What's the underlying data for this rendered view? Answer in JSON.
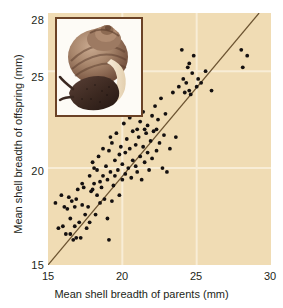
{
  "figure": {
    "kind": "scatter-plot",
    "background_color": "#ffffff",
    "plot_background_color": "#f0dcb4",
    "gridline_color": "#f8edd6",
    "point_color": "#141010",
    "line_color": "#6b5330",
    "inset": {
      "name": "snail-photo",
      "caption": "",
      "border_color": "#6b4226",
      "background_color": "#fdfbf6"
    }
  },
  "chart_data": {
    "type": "scatter",
    "title": "",
    "xlabel": "Mean shell breadth of parents (mm)",
    "ylabel": "Mean shell breadth of offspring (mm)",
    "xlim": [
      15,
      30
    ],
    "ylim": [
      15,
      28
    ],
    "xticks": [
      15,
      20,
      25,
      30
    ],
    "xticklabels": [
      "15",
      "20",
      "25",
      "30"
    ],
    "yticks": [
      15,
      20,
      25,
      28
    ],
    "yticklabels": [
      "15",
      "20",
      "25",
      "28"
    ],
    "grid": true,
    "gridlines_x": [
      20,
      25
    ],
    "gridlines_y": [
      20,
      25
    ],
    "legend": null,
    "trendline": {
      "type": "line",
      "label": "regression line",
      "x": [
        15.0,
        29.2
      ],
      "y": [
        15.0,
        28.0
      ]
    },
    "points": [
      [
        15.5,
        18.2
      ],
      [
        15.7,
        16.9
      ],
      [
        15.9,
        18.6
      ],
      [
        16.0,
        17.0
      ],
      [
        16.1,
        18.0
      ],
      [
        16.2,
        16.6
      ],
      [
        16.3,
        17.9
      ],
      [
        16.4,
        18.5
      ],
      [
        16.5,
        16.6
      ],
      [
        16.5,
        17.4
      ],
      [
        16.6,
        18.3
      ],
      [
        16.7,
        16.3
      ],
      [
        16.8,
        17.0
      ],
      [
        16.9,
        18.4
      ],
      [
        16.9,
        16.4
      ],
      [
        17.0,
        18.9
      ],
      [
        17.1,
        17.2
      ],
      [
        17.2,
        16.4
      ],
      [
        17.3,
        18.1
      ],
      [
        17.4,
        19.0
      ],
      [
        17.5,
        17.6
      ],
      [
        17.6,
        16.9
      ],
      [
        17.7,
        18.0
      ],
      [
        17.8,
        19.6
      ],
      [
        17.8,
        17.2
      ],
      [
        17.9,
        18.8
      ],
      [
        18.0,
        20.3
      ],
      [
        18.0,
        18.9
      ],
      [
        18.1,
        19.2
      ],
      [
        18.2,
        17.6
      ],
      [
        18.3,
        19.9
      ],
      [
        18.3,
        18.6
      ],
      [
        18.4,
        20.6
      ],
      [
        18.5,
        19.3
      ],
      [
        18.5,
        18.2
      ],
      [
        18.6,
        19.0
      ],
      [
        18.7,
        21.0
      ],
      [
        18.7,
        19.6
      ],
      [
        18.8,
        18.4
      ],
      [
        18.9,
        20.1
      ],
      [
        19.0,
        19.4
      ],
      [
        19.0,
        17.4
      ],
      [
        19.1,
        20.9
      ],
      [
        19.1,
        16.3
      ],
      [
        19.2,
        19.8
      ],
      [
        19.3,
        18.3
      ],
      [
        19.3,
        21.3
      ],
      [
        19.4,
        19.1
      ],
      [
        19.5,
        20.4
      ],
      [
        19.5,
        19.6
      ],
      [
        19.6,
        21.8
      ],
      [
        19.7,
        19.9
      ],
      [
        19.8,
        20.7
      ],
      [
        19.8,
        18.6
      ],
      [
        19.9,
        21.1
      ],
      [
        20.0,
        19.4
      ],
      [
        20.0,
        20.2
      ],
      [
        20.1,
        22.3
      ],
      [
        20.2,
        20.8
      ],
      [
        20.2,
        19.7
      ],
      [
        20.3,
        21.5
      ],
      [
        20.4,
        20.0
      ],
      [
        20.5,
        22.6
      ],
      [
        20.5,
        21.0
      ],
      [
        20.6,
        19.5
      ],
      [
        20.7,
        21.9
      ],
      [
        20.7,
        20.4
      ],
      [
        20.8,
        23.4
      ],
      [
        20.9,
        21.2
      ],
      [
        20.9,
        20.1
      ],
      [
        21.0,
        22.0
      ],
      [
        21.0,
        19.8
      ],
      [
        21.1,
        21.6
      ],
      [
        21.2,
        20.6
      ],
      [
        21.2,
        22.4
      ],
      [
        21.3,
        19.4
      ],
      [
        21.4,
        21.1
      ],
      [
        21.4,
        22.9
      ],
      [
        21.5,
        20.3
      ],
      [
        21.6,
        21.8
      ],
      [
        21.7,
        20.8
      ],
      [
        21.7,
        22.2
      ],
      [
        21.8,
        19.9
      ],
      [
        21.9,
        21.4
      ],
      [
        22.0,
        22.7
      ],
      [
        22.0,
        20.5
      ],
      [
        22.1,
        21.9
      ],
      [
        22.2,
        23.2
      ],
      [
        22.3,
        20.9
      ],
      [
        22.4,
        22.5
      ],
      [
        22.5,
        21.3
      ],
      [
        22.6,
        23.6
      ],
      [
        22.7,
        20.0
      ],
      [
        22.8,
        21.7
      ],
      [
        22.9,
        22.8
      ],
      [
        23.0,
        19.8
      ],
      [
        23.2,
        21.0
      ],
      [
        23.4,
        23.9
      ],
      [
        23.6,
        21.6
      ],
      [
        23.8,
        24.2
      ],
      [
        24.0,
        26.1
      ],
      [
        24.1,
        24.6
      ],
      [
        24.2,
        23.9
      ],
      [
        24.3,
        24.4
      ],
      [
        24.4,
        25.2
      ],
      [
        24.5,
        24.0
      ],
      [
        24.5,
        25.4
      ],
      [
        24.6,
        23.8
      ],
      [
        24.7,
        24.9
      ],
      [
        24.8,
        25.8
      ],
      [
        25.0,
        24.2
      ],
      [
        25.1,
        24.6
      ],
      [
        25.3,
        24.4
      ],
      [
        25.6,
        25.0
      ],
      [
        26.0,
        24.0
      ],
      [
        28.0,
        26.1
      ],
      [
        28.1,
        25.2
      ],
      [
        28.4,
        25.8
      ],
      [
        20.4,
        22.9
      ],
      [
        19.2,
        21.6
      ],
      [
        18.1,
        20.0
      ],
      [
        17.3,
        19.2
      ],
      [
        16.8,
        18.0
      ],
      [
        21.5,
        22.0
      ],
      [
        22.3,
        22.0
      ]
    ]
  }
}
